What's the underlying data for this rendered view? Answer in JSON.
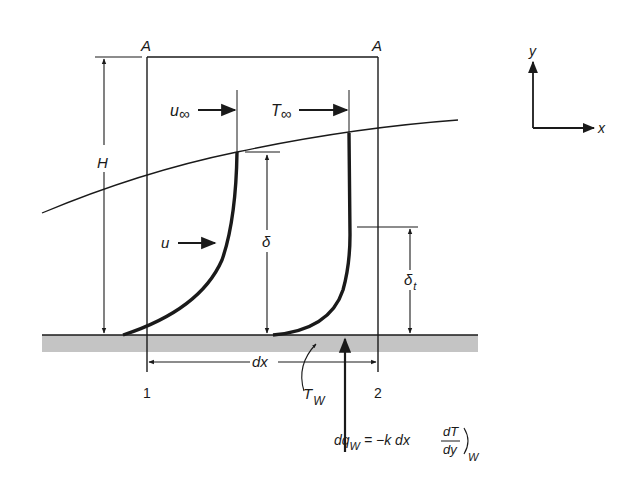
{
  "figure": {
    "colors": {
      "ink": "#1a1a1a",
      "plate": "#c4c4c4",
      "background": "#ffffff"
    },
    "labels": {
      "section_top_left": "A",
      "section_top_right": "A",
      "height": "H",
      "free_stream_velocity_sym": "u",
      "free_stream_velocity_sub": "∞",
      "free_stream_temp_sym": "T",
      "free_stream_temp_sub": "∞",
      "velocity_profile": "u",
      "velocity_bl_thickness": "δ",
      "thermal_bl_thickness_sym": "δ",
      "thermal_bl_thickness_sub": "t",
      "element_length": "dx",
      "station_1": "1",
      "station_2": "2",
      "wall_temp_sym": "T",
      "wall_temp_sub": "W",
      "axis_x": "x",
      "axis_y": "y"
    },
    "equation": {
      "lhs_sym": "dq",
      "lhs_sub": "W",
      "equals": "= −k dx",
      "frac_num": "dT",
      "frac_den": "dy",
      "eval_sub": "W"
    }
  }
}
